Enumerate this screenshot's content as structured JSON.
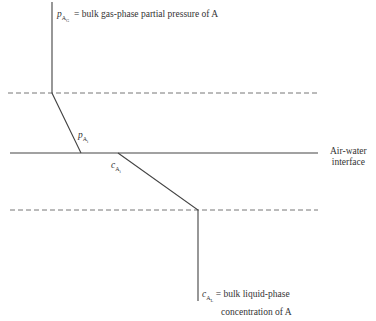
{
  "diagram": {
    "labels": {
      "top_symbol": "p",
      "top_sub": "A",
      "top_subsub": "G",
      "top_text": "= bulk gas-phase partial pressure of A",
      "pi_symbol": "p",
      "pi_sub": "A",
      "pi_subsub": "i",
      "ci_symbol": "c",
      "ci_sub": "A",
      "ci_subsub": "i",
      "interface_line1": "Air-water",
      "interface_line2": "interface",
      "bottom_symbol": "c",
      "bottom_sub": "A",
      "bottom_subsub": "L",
      "bottom_text_line1": "= bulk liquid-phase",
      "bottom_text_line2": "concentration of A"
    },
    "colors": {
      "line": "#444444",
      "dashed": "#777777",
      "text": "#333333"
    }
  }
}
